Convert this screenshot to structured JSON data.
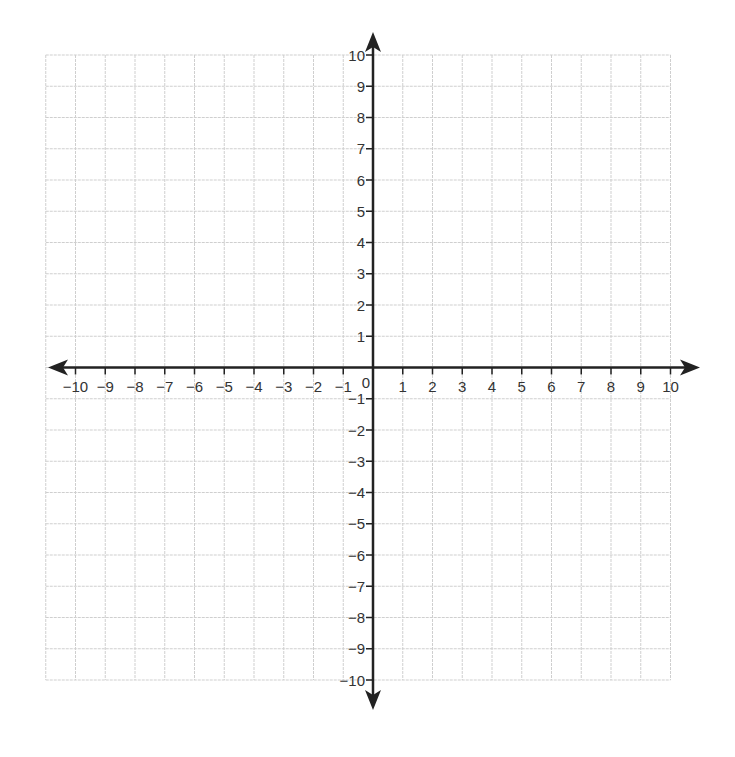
{
  "chart_data": {
    "type": "scatter",
    "title": "",
    "xlabel": "",
    "ylabel": "",
    "xlim": [
      -10,
      10
    ],
    "ylim": [
      -10,
      10
    ],
    "grid": true,
    "x_ticks": [
      -10,
      -9,
      -8,
      -7,
      -6,
      -5,
      -4,
      -3,
      -2,
      -1,
      1,
      2,
      3,
      4,
      5,
      6,
      7,
      8,
      9,
      10
    ],
    "y_ticks": [
      -10,
      -9,
      -8,
      -7,
      -6,
      -5,
      -4,
      -3,
      -2,
      -1,
      1,
      2,
      3,
      4,
      5,
      6,
      7,
      8,
      9,
      10
    ],
    "x_tick_labels": [
      "−10",
      "−9",
      "−8",
      "−7",
      "−6",
      "−5",
      "−4",
      "−3",
      "−2",
      "−1",
      "1",
      "2",
      "3",
      "4",
      "5",
      "6",
      "7",
      "8",
      "9",
      "10"
    ],
    "y_tick_labels": [
      "−10",
      "−9",
      "−8",
      "−7",
      "−6",
      "−5",
      "−4",
      "−3",
      "−2",
      "−1",
      "1",
      "2",
      "3",
      "4",
      "5",
      "6",
      "7",
      "8",
      "9",
      "10"
    ],
    "origin_label": "0",
    "series": [],
    "legend": null
  },
  "colors": {
    "axis": "#222222",
    "grid": "#cfcfcf",
    "label": "#333333",
    "background": "#ffffff"
  }
}
